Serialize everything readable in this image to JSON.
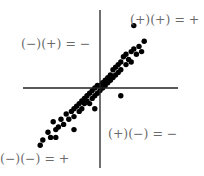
{
  "diagram": {
    "type": "scatter-quadrant",
    "quadrant_labels": {
      "top_right": "(+)(+) = +",
      "top_left": "(−)(+) = −",
      "bottom_right": "(+)(−) = −",
      "bottom_left": "(−)(−) = +"
    },
    "colors": {
      "points": "#000000",
      "axes": "#222222",
      "labels": "#6a6a6a"
    }
  },
  "chart_data": {
    "type": "scatter",
    "title": "",
    "xlabel": "",
    "ylabel": "",
    "grid": false,
    "points": [
      [
        -2.3,
        -2.2
      ],
      [
        -2.2,
        -2.0
      ],
      [
        -2.0,
        -1.7
      ],
      [
        -1.9,
        -1.9
      ],
      [
        -1.7,
        -1.6
      ],
      [
        -1.8,
        -1.3
      ],
      [
        -1.6,
        -1.5
      ],
      [
        -1.5,
        -1.2
      ],
      [
        -1.4,
        -1.4
      ],
      [
        -1.3,
        -1.0
      ],
      [
        -1.2,
        -1.2
      ],
      [
        -1.1,
        -0.9
      ],
      [
        -1.0,
        -1.1
      ],
      [
        -1.0,
        -0.8
      ],
      [
        -0.9,
        -0.7
      ],
      [
        -0.8,
        -0.9
      ],
      [
        -0.8,
        -0.6
      ],
      [
        -0.7,
        -0.8
      ],
      [
        -0.7,
        -0.5
      ],
      [
        -0.6,
        -0.6
      ],
      [
        -0.6,
        -0.4
      ],
      [
        -0.5,
        -0.5
      ],
      [
        -0.5,
        -0.3
      ],
      [
        -0.4,
        -0.6
      ],
      [
        -0.4,
        -0.2
      ],
      [
        -0.3,
        -0.4
      ],
      [
        -0.3,
        -0.1
      ],
      [
        -0.2,
        -0.3
      ],
      [
        -0.2,
        0.0
      ],
      [
        -0.1,
        -0.2
      ],
      [
        -0.1,
        0.1
      ],
      [
        0.0,
        -0.1
      ],
      [
        0.0,
        0.1
      ],
      [
        0.1,
        0.0
      ],
      [
        0.1,
        0.2
      ],
      [
        0.2,
        0.1
      ],
      [
        0.2,
        0.3
      ],
      [
        0.3,
        0.2
      ],
      [
        0.3,
        0.4
      ],
      [
        0.4,
        0.3
      ],
      [
        0.4,
        0.5
      ],
      [
        0.5,
        0.4
      ],
      [
        0.5,
        0.7
      ],
      [
        0.6,
        0.5
      ],
      [
        0.6,
        0.8
      ],
      [
        0.7,
        0.6
      ],
      [
        0.7,
        0.9
      ],
      [
        0.8,
        0.7
      ],
      [
        0.8,
        1.0
      ],
      [
        0.9,
        1.2
      ],
      [
        1.0,
        0.9
      ],
      [
        1.0,
        1.3
      ],
      [
        1.1,
        1.1
      ],
      [
        1.2,
        1.4
      ],
      [
        1.2,
        1.0
      ],
      [
        1.3,
        1.5
      ],
      [
        1.4,
        1.3
      ],
      [
        1.5,
        1.6
      ],
      [
        1.6,
        1.4
      ],
      [
        1.7,
        1.8
      ],
      [
        1.3,
        2.4
      ],
      [
        0.8,
        -0.3
      ],
      [
        -0.2,
        -0.8
      ],
      [
        -1.0,
        -1.6
      ],
      [
        -1.7,
        -1.9
      ]
    ],
    "xlim": [
      -3,
      3
    ],
    "ylim": [
      -3,
      3
    ]
  }
}
